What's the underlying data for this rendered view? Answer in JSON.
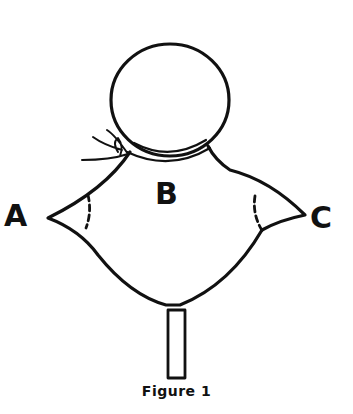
{
  "figure": {
    "caption": "Figure 1",
    "labels": {
      "left": "A",
      "center": "B",
      "right": "C"
    },
    "stroke_color": "#111111",
    "background_color": "#ffffff",
    "parts": [
      "head-circle",
      "neck-tie-ribbon",
      "collar",
      "body-cloth",
      "left-corner-dashed-fold",
      "right-corner-dashed-fold",
      "stick-handle"
    ]
  }
}
